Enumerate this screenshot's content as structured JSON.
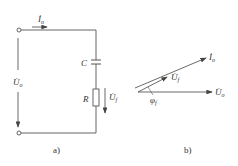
{
  "figure_a": {
    "caption": "a)",
    "current_label": "İ",
    "current_sub": "o",
    "input_voltage_label": "U̇",
    "input_voltage_sub": "o",
    "capacitor_label": "C",
    "resistor_label": "R",
    "output_voltage_label": "U̇",
    "output_voltage_sub": "f"
  },
  "figure_b": {
    "caption": "b)",
    "current_phasor_label": "İ",
    "current_phasor_sub": "o",
    "feedback_phasor_label": "U̇",
    "feedback_phasor_sub": "f",
    "input_phasor_label": "U̇",
    "input_phasor_sub": "o",
    "angle_label": "φ",
    "angle_sub": "f"
  },
  "colors": {
    "line": "#555555",
    "text": "#333333"
  }
}
